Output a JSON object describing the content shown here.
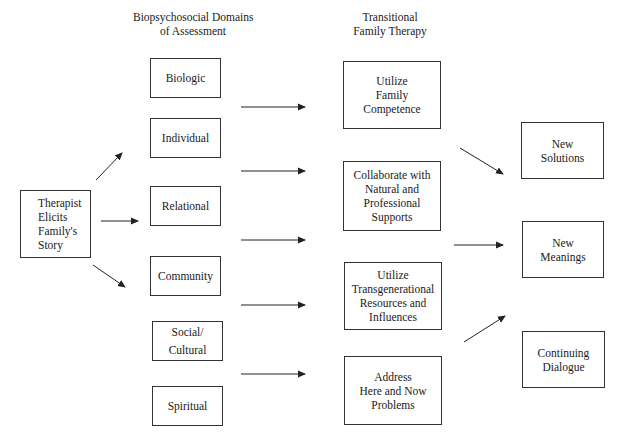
{
  "headers": {
    "domains": "Biopsychosocial Domains\nof Assessment",
    "domains_line1": "Biopsychosocial Domains",
    "domains_line2": "of Assessment",
    "therapy_line1": "Transitional",
    "therapy_line2": "Family Therapy"
  },
  "start": {
    "label": "Therapist\nElicits\nFamily's\nStory"
  },
  "domains": [
    {
      "label": "Biologic"
    },
    {
      "label": "Individual"
    },
    {
      "label": "Relational"
    },
    {
      "label": "Community"
    },
    {
      "label": "Social/\nCultural"
    },
    {
      "label": "Spiritual"
    }
  ],
  "therapy": [
    {
      "label": "Utilize\nFamily\nCompetence"
    },
    {
      "label": "Collaborate with\nNatural and\nProfessional\nSupports"
    },
    {
      "label": "Utilize\nTransgenerational\nResources and\nInfluences"
    },
    {
      "label": "Address\nHere and Now\nProblems"
    }
  ],
  "outcomes": [
    {
      "label": "New\nSolutions"
    },
    {
      "label": "New\nMeanings"
    },
    {
      "label": "Continuing\nDialogue"
    }
  ],
  "colors": {
    "line": "#222222",
    "border": "#333333",
    "background": "#ffffff"
  }
}
